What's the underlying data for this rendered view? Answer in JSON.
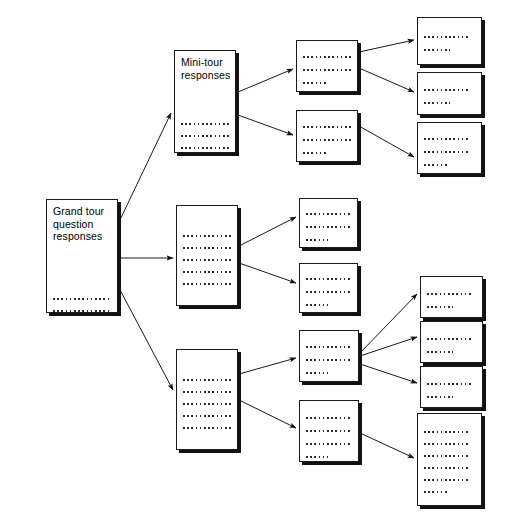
{
  "diagram": {
    "type": "tree-diagram",
    "background_color": "#ffffff",
    "node_fill": "#ffffff",
    "node_border_color": "#1a1a1a",
    "node_shadow_color": "#111111",
    "edge_color": "#1a1a1a",
    "text_color": "#000000",
    "nodes": [
      {
        "id": "grand-tour",
        "label": "Grand tour\nquestion\nresponses",
        "has_label": true,
        "x": 46,
        "y": 199,
        "width": 72,
        "height": 114,
        "text_lines": 5,
        "line_widths": [
          84,
          84,
          84,
          84,
          60
        ],
        "text_top": 55
      },
      {
        "id": "mini-tour",
        "label": "Mini-tour\nresponses",
        "has_label": true,
        "x": 174,
        "y": 50,
        "width": 62,
        "height": 103,
        "text_lines": 5,
        "line_widths": [
          80,
          80,
          80,
          80,
          26
        ],
        "text_top": 42
      },
      {
        "id": "branch-mid",
        "label": "",
        "has_label": false,
        "x": 176,
        "y": 205,
        "width": 62,
        "height": 101,
        "text_lines": 5,
        "line_widths": [
          80,
          80,
          80,
          80,
          62
        ],
        "text_top": 24
      },
      {
        "id": "branch-low",
        "label": "",
        "has_label": false,
        "x": 176,
        "y": 349,
        "width": 62,
        "height": 101,
        "text_lines": 5,
        "line_widths": [
          80,
          80,
          80,
          80,
          62
        ],
        "text_top": 24
      },
      {
        "id": "c3-r1",
        "label": "",
        "has_label": false,
        "x": 296,
        "y": 40,
        "width": 62,
        "height": 52,
        "text_lines": 3,
        "line_widths": [
          50,
          50,
          24
        ],
        "text_top": 10
      },
      {
        "id": "c3-r2",
        "label": "",
        "has_label": false,
        "x": 296,
        "y": 110,
        "width": 62,
        "height": 52,
        "text_lines": 3,
        "line_widths": [
          50,
          50,
          24
        ],
        "text_top": 10
      },
      {
        "id": "c3-r3",
        "label": "",
        "has_label": false,
        "x": 299,
        "y": 198,
        "width": 59,
        "height": 50,
        "text_lines": 3,
        "line_widths": [
          50,
          50,
          22
        ],
        "text_top": 9
      },
      {
        "id": "c3-r4",
        "label": "",
        "has_label": false,
        "x": 299,
        "y": 263,
        "width": 59,
        "height": 50,
        "text_lines": 3,
        "line_widths": [
          50,
          50,
          22
        ],
        "text_top": 9
      },
      {
        "id": "c3-r5",
        "label": "",
        "has_label": false,
        "x": 299,
        "y": 330,
        "width": 60,
        "height": 52,
        "text_lines": 3,
        "line_widths": [
          50,
          50,
          22
        ],
        "text_top": 10
      },
      {
        "id": "c3-r6",
        "label": "",
        "has_label": false,
        "x": 299,
        "y": 400,
        "width": 60,
        "height": 62,
        "text_lines": 4,
        "line_widths": [
          50,
          50,
          50,
          22
        ],
        "text_top": 11
      },
      {
        "id": "c4-r1",
        "label": "",
        "has_label": false,
        "x": 417,
        "y": 17,
        "width": 65,
        "height": 48,
        "text_lines": 2,
        "line_widths": [
          46,
          26
        ],
        "text_top": 13
      },
      {
        "id": "c4-r2",
        "label": "",
        "has_label": false,
        "x": 417,
        "y": 72,
        "width": 65,
        "height": 43,
        "text_lines": 2,
        "line_widths": [
          46,
          26
        ],
        "text_top": 11
      },
      {
        "id": "c4-r3",
        "label": "",
        "has_label": false,
        "x": 417,
        "y": 122,
        "width": 65,
        "height": 52,
        "text_lines": 3,
        "line_widths": [
          46,
          46,
          24
        ],
        "text_top": 10
      },
      {
        "id": "c4-r4",
        "label": "",
        "has_label": false,
        "x": 420,
        "y": 276,
        "width": 63,
        "height": 42,
        "text_lines": 2,
        "line_widths": [
          46,
          26
        ],
        "text_top": 11
      },
      {
        "id": "c4-r5",
        "label": "",
        "has_label": false,
        "x": 420,
        "y": 321,
        "width": 63,
        "height": 42,
        "text_lines": 2,
        "line_widths": [
          46,
          26
        ],
        "text_top": 11
      },
      {
        "id": "c4-r6",
        "label": "",
        "has_label": false,
        "x": 420,
        "y": 366,
        "width": 63,
        "height": 42,
        "text_lines": 2,
        "line_widths": [
          46,
          26
        ],
        "text_top": 11
      },
      {
        "id": "c4-r7",
        "label": "",
        "has_label": false,
        "x": 417,
        "y": 413,
        "width": 65,
        "height": 93,
        "text_lines": 6,
        "line_widths": [
          46,
          46,
          46,
          46,
          46,
          24
        ],
        "text_top": 12
      }
    ],
    "edges": [
      {
        "id": "e1",
        "from": "grand-tour",
        "to": "mini-tour",
        "x1": 119,
        "y1": 222,
        "x2": 171,
        "y2": 113
      },
      {
        "id": "e2",
        "from": "grand-tour",
        "to": "branch-mid",
        "x1": 119,
        "y1": 258,
        "x2": 173,
        "y2": 258
      },
      {
        "id": "e3",
        "from": "grand-tour",
        "to": "branch-low",
        "x1": 119,
        "y1": 288,
        "x2": 173,
        "y2": 390
      },
      {
        "id": "e4",
        "from": "mini-tour",
        "to": "c3-r1",
        "x1": 238,
        "y1": 92,
        "x2": 293,
        "y2": 69
      },
      {
        "id": "e5",
        "from": "mini-tour",
        "to": "c3-r2",
        "x1": 238,
        "y1": 115,
        "x2": 293,
        "y2": 135
      },
      {
        "id": "e6",
        "from": "c3-r1",
        "to": "c4-r1",
        "x1": 359,
        "y1": 52,
        "x2": 414,
        "y2": 40
      },
      {
        "id": "e7",
        "from": "c3-r1",
        "to": "c4-r2",
        "x1": 359,
        "y1": 68,
        "x2": 414,
        "y2": 92
      },
      {
        "id": "e8",
        "from": "c3-r2",
        "to": "c4-r3",
        "x1": 359,
        "y1": 126,
        "x2": 414,
        "y2": 157
      },
      {
        "id": "e9",
        "from": "branch-mid",
        "to": "c3-r3",
        "x1": 239,
        "y1": 246,
        "x2": 296,
        "y2": 217
      },
      {
        "id": "e10",
        "from": "branch-mid",
        "to": "c3-r4",
        "x1": 239,
        "y1": 263,
        "x2": 296,
        "y2": 283
      },
      {
        "id": "e11",
        "from": "branch-low",
        "to": "c3-r5",
        "x1": 239,
        "y1": 374,
        "x2": 296,
        "y2": 358
      },
      {
        "id": "e12",
        "from": "branch-low",
        "to": "c3-r6",
        "x1": 239,
        "y1": 400,
        "x2": 296,
        "y2": 428
      },
      {
        "id": "e13",
        "from": "c3-r5",
        "to": "c4-r4",
        "x1": 360,
        "y1": 353,
        "x2": 417,
        "y2": 294
      },
      {
        "id": "e14",
        "from": "c3-r5",
        "to": "c4-r5",
        "x1": 360,
        "y1": 356,
        "x2": 417,
        "y2": 337
      },
      {
        "id": "e15",
        "from": "c3-r5",
        "to": "c4-r6",
        "x1": 360,
        "y1": 364,
        "x2": 417,
        "y2": 383
      },
      {
        "id": "e16",
        "from": "c3-r6",
        "to": "c4-r7",
        "x1": 360,
        "y1": 433,
        "x2": 414,
        "y2": 458
      }
    ]
  }
}
